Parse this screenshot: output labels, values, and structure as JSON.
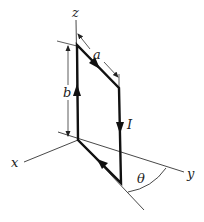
{
  "diagram": {
    "labels": {
      "z": "z",
      "x": "x",
      "y": "y",
      "a": "a",
      "b": "b",
      "current": "I",
      "angle": "θ"
    },
    "colors": {
      "line": "#222222",
      "loop": "#111111",
      "background": "#ffffff"
    }
  }
}
